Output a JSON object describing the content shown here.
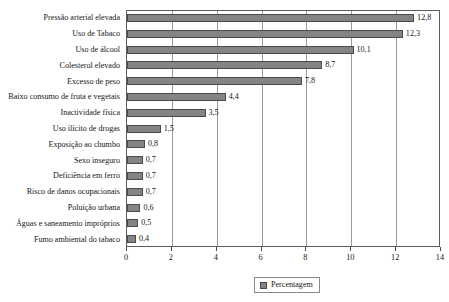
{
  "chart_data": {
    "type": "bar",
    "orientation": "horizontal",
    "title": "",
    "xlabel": "",
    "ylabel": "",
    "xlim": [
      0,
      14
    ],
    "xticks": [
      0,
      2,
      4,
      6,
      8,
      10,
      12,
      14
    ],
    "xtick_labels": [
      "0",
      "2",
      "4",
      "6",
      "8",
      "10",
      "12",
      "14"
    ],
    "grid": "vertical",
    "legend": {
      "position": "bottom-center",
      "entries": [
        "Percentagem"
      ]
    },
    "decimal_separator": ",",
    "series": [
      {
        "name": "Percentagem",
        "color": "#848484",
        "values": [
          12.8,
          12.3,
          10.1,
          8.7,
          7.8,
          4.4,
          3.5,
          1.5,
          0.8,
          0.7,
          0.7,
          0.7,
          0.6,
          0.5,
          0.4
        ]
      }
    ],
    "categories": [
      "Pressão arterial elevada",
      "Uso de Tabaco",
      "Uso de álcool",
      "Colesterol elevado",
      "Excesso de peso",
      "Baixo consumo de fruta e vegetais",
      "Inactividade física",
      "Uso ilícito de drogas",
      "Exposição ao chumbo",
      "Sexo inseguro",
      "Deficiência em ferro",
      "Risco de danos ocupacionais",
      "Poluição urbana",
      "Águas e saneamento impróprios",
      "Fumo ambiental do tabaco"
    ],
    "data_labels": [
      "12,8",
      "12,3",
      "10,1",
      "8,7",
      "7,8",
      "4,4",
      "3,5",
      "1,5",
      "0,8",
      "0,7",
      "0,7",
      "0,7",
      "0,6",
      "0,5",
      "0,4"
    ]
  }
}
